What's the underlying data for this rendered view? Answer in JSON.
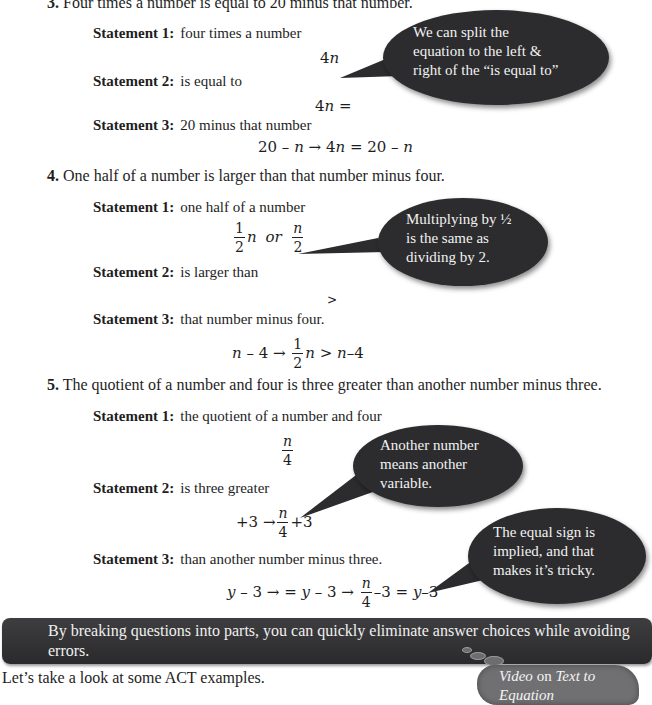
{
  "questions": [
    {
      "number": "3.",
      "text": "Four times a number is equal to 20 minus that number.",
      "statements": [
        {
          "label": "Statement 1:",
          "text": "four times a number",
          "math": "4n"
        },
        {
          "label": "Statement 2:",
          "text": "is equal to",
          "math": "4n ="
        },
        {
          "label": "Statement 3:",
          "text": "20 minus that number",
          "math": "20 – n → 4n = 20 – n"
        }
      ],
      "callout": "We can split the equation to the left & right of the “is equal to”",
      "callout_lines": [
        "We can split the",
        "equation to the left &",
        "right of the “is equal to”"
      ]
    },
    {
      "number": "4.",
      "text": "One half of a number is larger than that number minus four.",
      "statements": [
        {
          "label": "Statement 1:",
          "text": "one half of a number",
          "math": "1/2 n or n/2"
        },
        {
          "label": "Statement 2:",
          "text": "is larger than",
          "math": ">"
        },
        {
          "label": "Statement 3:",
          "text": "that number minus four.",
          "math": "n – 4 → 1/2 n > n – 4"
        }
      ],
      "callout": "Multiplying by ½ is the same as dividing by 2.",
      "callout_lines": [
        "Multiplying by ½",
        "is the same as",
        "dividing by 2."
      ]
    },
    {
      "number": "5.",
      "text": "The quotient of a number and four is three greater than another number minus three.",
      "statements": [
        {
          "label": "Statement 1:",
          "text": "the quotient of a number and four",
          "math": "n/4"
        },
        {
          "label": "Statement 2:",
          "text": "is three greater",
          "math": "+3 → n/4 + 3"
        },
        {
          "label": "Statement 3:",
          "text": "than another number minus three.",
          "math": "y – 3 → = y – 3 → n/4 – 3 = y – 3"
        }
      ],
      "callouts": [
        {
          "lines": [
            "Another number",
            "means another",
            "variable."
          ]
        },
        {
          "lines": [
            "The equal sign is",
            "implied, and that",
            "makes it’s tricky."
          ]
        }
      ]
    }
  ],
  "math_tokens": {
    "n": "n",
    "y": "y",
    "one": "1",
    "two": "2",
    "four": "4",
    "or": "or",
    "arrow": "→",
    "eq3_s1": "4",
    "eq3_s2": "4",
    "eq3_s2b": " =",
    "eq3_s3a": "20 – ",
    "eq3_s3b": "  →  4",
    "eq3_s3c": " = 20 – ",
    "gt": ">",
    "eq4_s3a": " – 4  →  ",
    "eq4_s3b": " > ",
    "eq4_s3c": "–4",
    "eq5_s2a": "+3  →",
    "eq5_s2b": "+3",
    "eq5_s3a": " – 3  →  = ",
    "eq5_s3b": " – 3  →  ",
    "eq5_s3c": "–3 = ",
    "eq5_s3d": "–3"
  },
  "banner": {
    "text": "By breaking questions into parts, you can quickly eliminate answer choices while avoiding errors."
  },
  "footer": {
    "text": "Let’s take a look at some ACT examples."
  },
  "video_cloud": {
    "video_word": "Video",
    "on_word": " on ",
    "title": "Text to",
    "title2": "Equation"
  }
}
